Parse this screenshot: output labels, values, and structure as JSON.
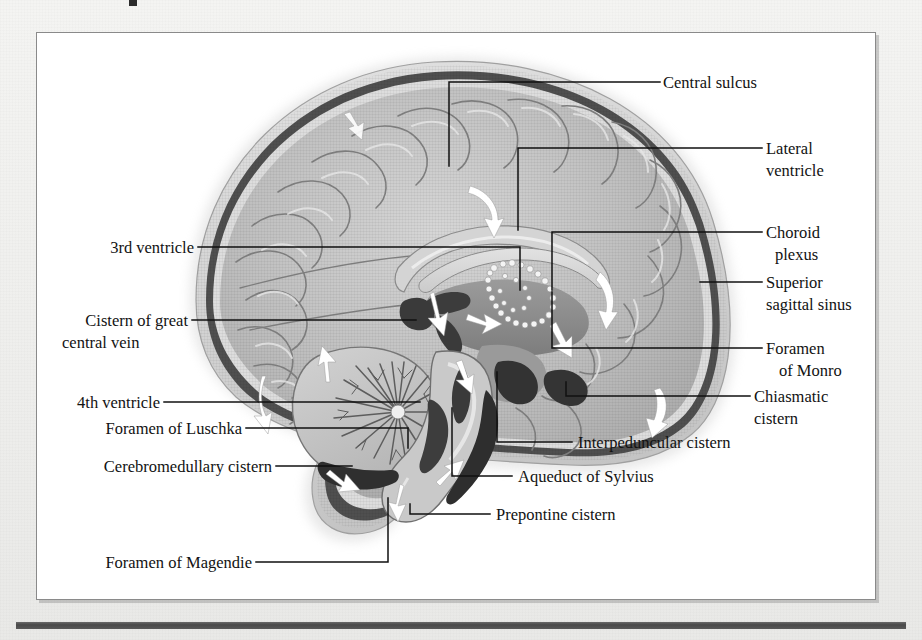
{
  "figure": {
    "type": "anatomical-illustration",
    "view": "midsagittal",
    "style": "grayscale medical illustration",
    "colors": {
      "page_background": "#f2f2f0",
      "figure_background": "#ffffff",
      "frame_border": "#8a8a8a",
      "bottom_rule": "#4a4a4a",
      "label_text": "#121212",
      "leader_line": "#101010",
      "cortex_fill": "#b9b9b9",
      "cortex_light": "#d2d2d2",
      "dura_dark": "#4c4c4c",
      "skull_outer": "#cfcfcf",
      "ventricle_fill": "#d9d9d9",
      "deep_structure": "#8f8f8f",
      "csf_arrow": "#ffffff",
      "cerebellum_fill": "#c6c6c6"
    }
  },
  "labels": {
    "right": [
      {
        "id": "central-sulcus",
        "text": "Central sulcus",
        "lines": [
          "Central sulcus"
        ]
      },
      {
        "id": "lateral-ventricle",
        "text": "Lateral ventricle",
        "lines": [
          "Lateral",
          "ventricle"
        ]
      },
      {
        "id": "choroid-plexus",
        "text": "Choroid plexus",
        "lines": [
          "Choroid",
          "plexus"
        ]
      },
      {
        "id": "superior-sagittal-sinus",
        "text": "Superior sagittal sinus",
        "lines": [
          "Superior",
          "sagittal sinus"
        ]
      },
      {
        "id": "foramen-of-monro",
        "text": "Foramen of Monro",
        "lines": [
          "Foramen",
          "of Monro"
        ]
      },
      {
        "id": "chiasmatic-cistern",
        "text": "Chiasmatic cistern",
        "lines": [
          "Chiasmatic",
          "cistern"
        ]
      }
    ],
    "left": [
      {
        "id": "third-ventricle",
        "text": "3rd ventricle",
        "lines": [
          "3rd ventricle"
        ]
      },
      {
        "id": "cistern-of-great-central-vein",
        "text": "Cistern of great central vein",
        "lines": [
          "Cistern of great",
          "central vein"
        ]
      },
      {
        "id": "fourth-ventricle",
        "text": "4th ventricle",
        "lines": [
          "4th ventricle"
        ]
      },
      {
        "id": "foramen-of-luschka",
        "text": "Foramen  of Luschka",
        "lines": [
          "Foramen  of Luschka"
        ]
      },
      {
        "id": "cerebromedullary-cistern",
        "text": "Cerebromedullary cistern",
        "lines": [
          "Cerebromedullary cistern"
        ]
      },
      {
        "id": "foramen-of-magendie",
        "text": "Foramen of Magendie",
        "lines": [
          "Foramen of Magendie"
        ]
      }
    ],
    "bottom": [
      {
        "id": "interpeduncular-cistern",
        "text": "Interpeduncular cistern",
        "lines": [
          "Interpeduncular cistern"
        ]
      },
      {
        "id": "aqueduct-of-sylvius",
        "text": "Aqueduct of Sylvius",
        "lines": [
          "Aqueduct of Sylvius"
        ]
      },
      {
        "id": "prepontine-cistern",
        "text": "Prepontine cistern",
        "lines": [
          "Prepontine cistern"
        ]
      }
    ]
  },
  "text": {
    "central_sulcus": "Central sulcus",
    "lateral_1": "Lateral",
    "lateral_2": "ventricle",
    "choroid_1": "Choroid",
    "choroid_2": "plexus",
    "sss_1": "Superior",
    "sss_2": "sagittal sinus",
    "monro_1": "Foramen",
    "monro_2": "of Monro",
    "chiasmatic_1": "Chiasmatic",
    "chiasmatic_2": "cistern",
    "third_ventricle": "3rd ventricle",
    "cistern_great_1": "Cistern of great",
    "cistern_great_2": "central vein",
    "fourth_ventricle": "4th ventricle",
    "luschka": "Foramen  of Luschka",
    "cerebromedullary": "Cerebromedullary cistern",
    "magendie": "Foramen of Magendie",
    "interpeduncular": "Interpeduncular cistern",
    "aqueduct": "Aqueduct of Sylvius",
    "prepontine": "Prepontine cistern"
  }
}
